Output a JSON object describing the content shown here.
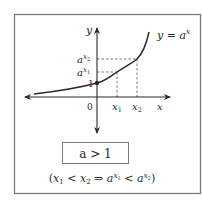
{
  "figure": {
    "curve_label": "y = a",
    "curve_label_sup": "x",
    "y_axis_label": "y",
    "x_axis_label": "x",
    "origin_label": "0",
    "one_label": "1",
    "ax2_base": "a",
    "ax2_sup": "x",
    "ax2_sub": "2",
    "ax1_base": "a",
    "ax1_sup": "x",
    "ax1_sub": "1",
    "x1_label": "x",
    "x1_sub": "1",
    "x2_label": "x",
    "x2_sub": "2"
  },
  "condition": {
    "label": "a > 1"
  },
  "implication": {
    "open": "(",
    "x1": "x",
    "x1_sub": "1",
    "lt1": " < ",
    "x2": "x",
    "x2_sub": "2",
    "arrow": " ⇒  ",
    "a1": "a",
    "a1_sup": "x",
    "a1_sup_sub": "1",
    "lt2": " < ",
    "a2": "a",
    "a2_sup": "x",
    "a2_sup_sub": "2",
    "close": ")"
  },
  "colors": {
    "stroke": "#2a2a2a",
    "box_border": "#7a7a7a",
    "dashed": "#555555"
  }
}
